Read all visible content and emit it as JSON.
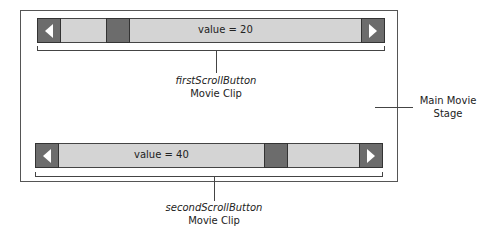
{
  "diagram": {
    "stage_label_line1": "Main Movie",
    "stage_label_line2": "Stage",
    "first_clip": {
      "value_text": "value = 20",
      "value": 20,
      "instance_name": "firstScrollButton",
      "type_label": "Movie Clip",
      "left_icon": "left-arrow-icon",
      "right_icon": "right-arrow-icon"
    },
    "second_clip": {
      "value_text": "value = 40",
      "value": 40,
      "instance_name": "secondScrollButton",
      "type_label": "Movie Clip",
      "left_icon": "left-arrow-icon",
      "right_icon": "right-arrow-icon"
    },
    "colors": {
      "track": "#d4d4d4",
      "button": "#6c6c6c",
      "arrow": "#ffffff",
      "border": "#444444"
    }
  }
}
